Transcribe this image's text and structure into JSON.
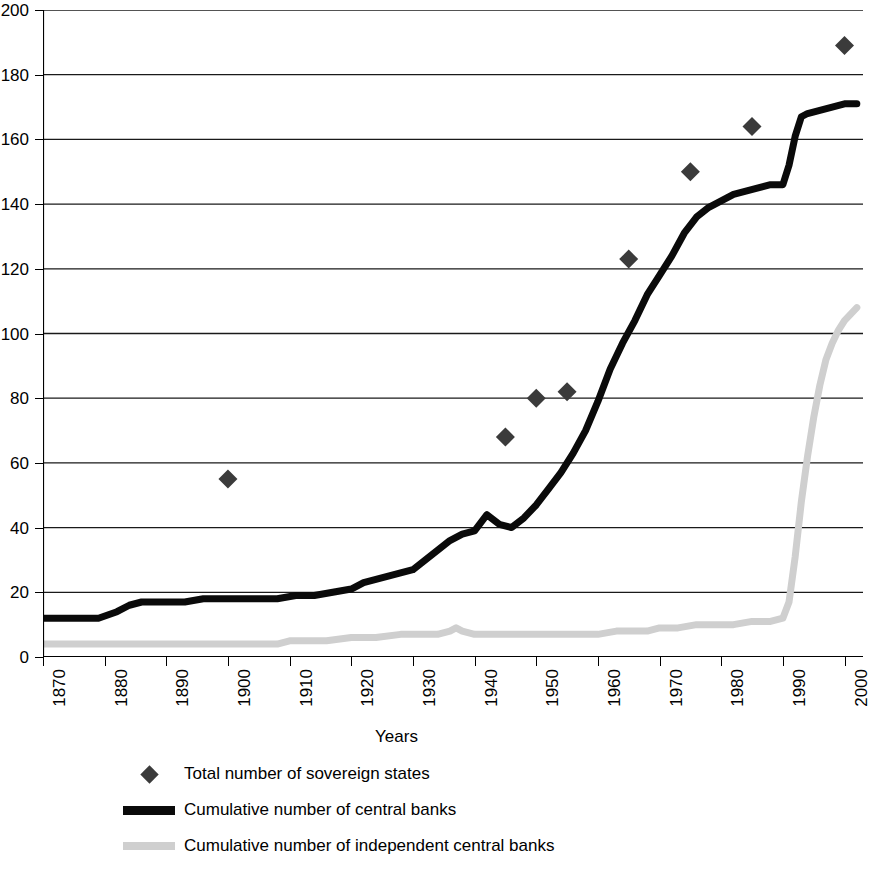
{
  "chart_data": {
    "type": "line",
    "title": "",
    "xlabel": "Years",
    "ylabel": "",
    "xlim": [
      1870,
      2003
    ],
    "ylim": [
      0,
      200
    ],
    "grid": true,
    "grid_axis": "y",
    "legend_position": "bottom-left",
    "x_tick_labels": [
      "1870",
      "1880",
      "1890",
      "1900",
      "1910",
      "1920",
      "1930",
      "1940",
      "1950",
      "1960",
      "1970",
      "1980",
      "1990",
      "2000"
    ],
    "x_ticks": [
      1870,
      1880,
      1890,
      1900,
      1910,
      1920,
      1930,
      1940,
      1950,
      1960,
      1970,
      1980,
      1990,
      2000
    ],
    "y_tick_labels": [
      "0",
      "20",
      "40",
      "60",
      "80",
      "100",
      "120",
      "140",
      "160",
      "180",
      "200"
    ],
    "y_ticks": [
      0,
      20,
      40,
      60,
      80,
      100,
      120,
      140,
      160,
      180,
      200
    ],
    "series": [
      {
        "name": "Total number of sovereign states",
        "type": "scatter",
        "marker": "diamond",
        "color": "#3b3b3b",
        "points": [
          {
            "x": 1900,
            "y": 55
          },
          {
            "x": 1945,
            "y": 68
          },
          {
            "x": 1950,
            "y": 80
          },
          {
            "x": 1955,
            "y": 82
          },
          {
            "x": 1965,
            "y": 123
          },
          {
            "x": 1975,
            "y": 150
          },
          {
            "x": 1985,
            "y": 164
          },
          {
            "x": 2000,
            "y": 189
          }
        ]
      },
      {
        "name": "Cumulative number of central banks",
        "type": "line",
        "color": "#0a0a0a",
        "x": [
          1870,
          1873,
          1876,
          1879,
          1882,
          1884,
          1886,
          1888,
          1890,
          1893,
          1896,
          1899,
          1902,
          1905,
          1908,
          1911,
          1914,
          1917,
          1920,
          1922,
          1924,
          1926,
          1928,
          1930,
          1932,
          1934,
          1936,
          1938,
          1940,
          1942,
          1944,
          1946,
          1948,
          1950,
          1952,
          1954,
          1956,
          1958,
          1960,
          1962,
          1964,
          1966,
          1968,
          1970,
          1972,
          1974,
          1976,
          1978,
          1980,
          1982,
          1984,
          1986,
          1988,
          1990,
          1991,
          1992,
          1993,
          1994,
          1996,
          1998,
          2000,
          2002
        ],
        "values": [
          12,
          12,
          12,
          12,
          14,
          16,
          17,
          17,
          17,
          17,
          18,
          18,
          18,
          18,
          18,
          19,
          19,
          20,
          21,
          23,
          24,
          25,
          26,
          27,
          30,
          33,
          36,
          38,
          39,
          44,
          41,
          40,
          43,
          47,
          52,
          57,
          63,
          70,
          79,
          89,
          97,
          104,
          112,
          118,
          124,
          131,
          136,
          139,
          141,
          143,
          144,
          145,
          146,
          146,
          152,
          161,
          167,
          168,
          169,
          170,
          171,
          171
        ]
      },
      {
        "name": "Cumulative number of independent central banks",
        "type": "line",
        "color": "#cfcfcf",
        "x": [
          1870,
          1880,
          1890,
          1900,
          1906,
          1908,
          1910,
          1913,
          1916,
          1920,
          1924,
          1928,
          1930,
          1932,
          1934,
          1936,
          1937,
          1938,
          1940,
          1942,
          1944,
          1946,
          1948,
          1950,
          1952,
          1955,
          1958,
          1960,
          1963,
          1966,
          1968,
          1970,
          1973,
          1976,
          1979,
          1982,
          1985,
          1988,
          1990,
          1991,
          1992,
          1993,
          1994,
          1995,
          1996,
          1997,
          1998,
          1999,
          2000,
          2001,
          2002
        ],
        "values": [
          4,
          4,
          4,
          4,
          4,
          4,
          5,
          5,
          5,
          6,
          6,
          7,
          7,
          7,
          7,
          8,
          9,
          8,
          7,
          7,
          7,
          7,
          7,
          7,
          7,
          7,
          7,
          7,
          8,
          8,
          8,
          9,
          9,
          10,
          10,
          10,
          11,
          11,
          12,
          17,
          31,
          48,
          62,
          74,
          84,
          92,
          97,
          101,
          104,
          106,
          108
        ]
      }
    ]
  },
  "legend": {
    "items": [
      {
        "label": "Total number of sovereign states",
        "key": "diamond-marker"
      },
      {
        "label": "Cumulative number of central banks",
        "key": "solid-black-line"
      },
      {
        "label": "Cumulative number of independent central banks",
        "key": "gray-line"
      }
    ]
  },
  "axis_title": {
    "x": "Years"
  }
}
